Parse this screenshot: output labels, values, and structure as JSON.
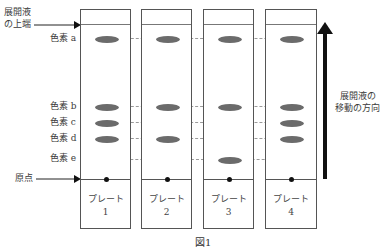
{
  "labels": {
    "solvent_front": [
      "展開液",
      "の上端"
    ],
    "pigment_a": "色素 a",
    "pigment_b": "色素 b",
    "pigment_c": "色素 c",
    "pigment_d": "色素 d",
    "pigment_e": "色素 e",
    "origin": "原点",
    "direction": [
      "展開液の",
      "移動の方向"
    ],
    "figure_caption": "図1"
  },
  "plates": [
    {
      "name": "プレート",
      "number": "1",
      "spots": [
        "a",
        "b",
        "c",
        "d"
      ]
    },
    {
      "name": "プレート",
      "number": "2",
      "spots": [
        "a",
        "b",
        "d"
      ]
    },
    {
      "name": "プレート",
      "number": "3",
      "spots": [
        "a",
        "b",
        "c",
        "e"
      ]
    },
    {
      "name": "プレート",
      "number": "4",
      "spots": [
        "a",
        "b",
        "c",
        "d"
      ]
    }
  ],
  "colors": {
    "spot": "#6b6b6b",
    "line": "#555555",
    "arrow": "#111111"
  }
}
